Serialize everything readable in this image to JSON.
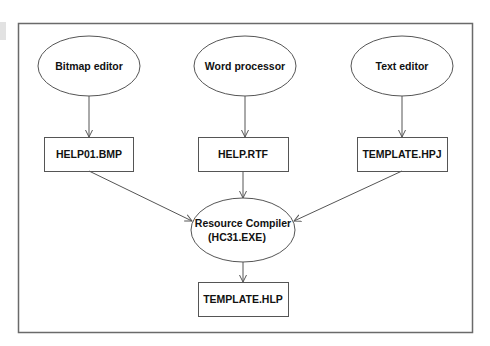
{
  "diagram": {
    "type": "flowchart",
    "colors": {
      "stroke": "#555555",
      "frame": "#6a6a6a",
      "text": "#111111",
      "background": "#ffffff"
    },
    "nodes": {
      "bitmap_editor": {
        "shape": "ellipse",
        "label": "Bitmap editor"
      },
      "word_processor": {
        "shape": "ellipse",
        "label": "Word processor"
      },
      "text_editor": {
        "shape": "ellipse",
        "label": "Text editor"
      },
      "help01_bmp": {
        "shape": "rect",
        "label": "HELP01.BMP"
      },
      "help_rtf": {
        "shape": "rect",
        "label": "HELP.RTF"
      },
      "template_hpj": {
        "shape": "rect",
        "label": "TEMPLATE.HPJ"
      },
      "resource_compiler": {
        "shape": "ellipse",
        "label_line1": "Resource Compiler",
        "label_line2": "(HC31.EXE)"
      },
      "template_hlp": {
        "shape": "rect",
        "label": "TEMPLATE.HLP"
      }
    },
    "edges": [
      {
        "from": "Bitmap editor",
        "to": "HELP01.BMP"
      },
      {
        "from": "Word processor",
        "to": "HELP.RTF"
      },
      {
        "from": "Text editor",
        "to": "TEMPLATE.HPJ"
      },
      {
        "from": "HELP01.BMP",
        "to": "Resource Compiler (HC31.EXE)"
      },
      {
        "from": "HELP.RTF",
        "to": "Resource Compiler (HC31.EXE)"
      },
      {
        "from": "TEMPLATE.HPJ",
        "to": "Resource Compiler (HC31.EXE)"
      },
      {
        "from": "Resource Compiler (HC31.EXE)",
        "to": "TEMPLATE.HLP"
      }
    ]
  }
}
